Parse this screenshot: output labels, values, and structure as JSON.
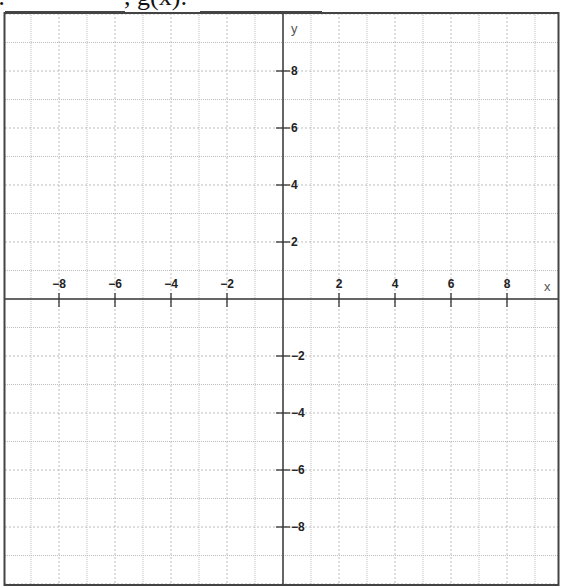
{
  "header": {
    "prefix": ":",
    "separator": ", g(x):",
    "blank1": "",
    "blank2": ""
  },
  "graph": {
    "x_label": "x",
    "y_label": "y",
    "x_min": -10,
    "x_max": 10,
    "y_min": -10,
    "y_max": 10,
    "grid_step": 1,
    "tick_step": 2,
    "x_tick_labels": [
      "-8",
      "-6",
      "-4",
      "-2",
      "2",
      "4",
      "6",
      "8"
    ],
    "y_tick_labels": [
      "8",
      "6",
      "4",
      "2",
      "-2",
      "-4",
      "-6",
      "-8"
    ],
    "colors": {
      "axis": "#333333",
      "border": "#444444",
      "grid": "#bdbdbd",
      "label": "#222222"
    }
  }
}
